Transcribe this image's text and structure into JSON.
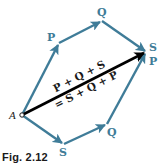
{
  "figure": {
    "caption": "Fig. 2.12",
    "colors": {
      "component_arrow": "#3f7c98",
      "resultant_arrow": "#000000",
      "label_teal": "#3f7c98",
      "label_dark": "#1a1a1a"
    },
    "origin_label": "A",
    "upper_path": {
      "vectors": [
        "P",
        "Q",
        "S"
      ],
      "labels": {
        "first": "P",
        "second": "Q",
        "third": "S"
      }
    },
    "lower_path": {
      "vectors": [
        "S",
        "Q",
        "P"
      ],
      "labels": {
        "first": "S",
        "second": "Q",
        "third": "P"
      }
    },
    "resultant": {
      "equation_line1": "P + Q + S",
      "equation_line2": "= S + Q + P"
    }
  }
}
